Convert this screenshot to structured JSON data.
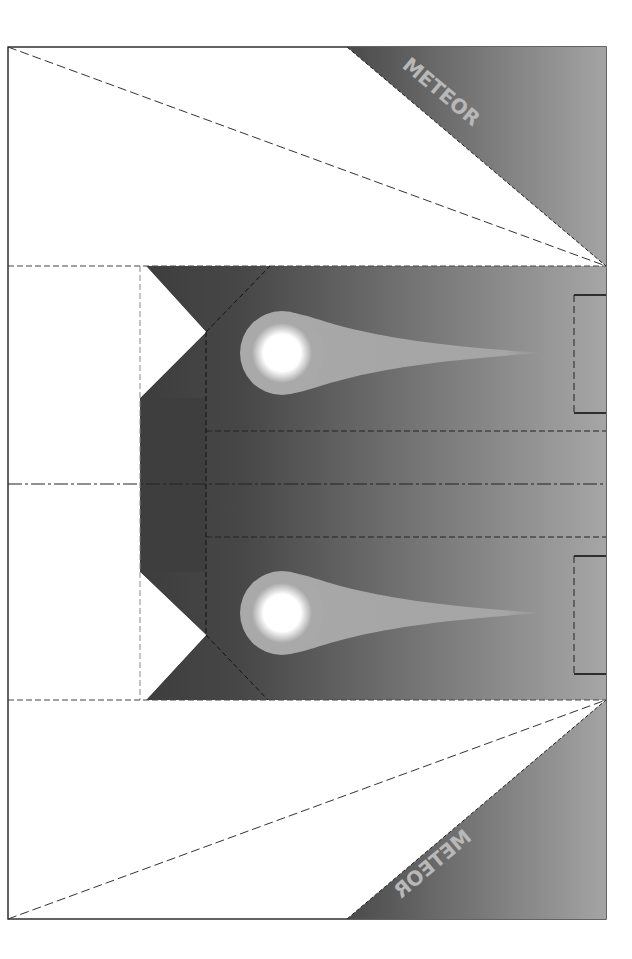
{
  "template": {
    "title": "Meteor papercraft cutout template",
    "labels": {
      "top": "METEOR",
      "bottom": "METEOR"
    }
  },
  "colors": {
    "gradient_dark": "#3c3c3c",
    "gradient_light": "#a8a8a8",
    "comet_halo": "#a9a9a9",
    "comet_core": "#ffffff",
    "label_text": "#b8b8b8",
    "cut_line": "#1a1a1a",
    "fold_line": "#333333",
    "paper": "#ffffff"
  },
  "comets": [
    {
      "name": "upper-comet",
      "cx": 282,
      "cy": 353,
      "r": 42,
      "tail_end_x": 545
    },
    {
      "name": "lower-comet",
      "cx": 282,
      "cy": 613,
      "r": 42,
      "tail_end_x": 545
    }
  ],
  "tabs": [
    {
      "name": "upper-glue-tab",
      "x": 574,
      "y": 295,
      "w": 32,
      "h": 118
    },
    {
      "name": "lower-glue-tab",
      "x": 574,
      "y": 556,
      "w": 32,
      "h": 118
    }
  ]
}
